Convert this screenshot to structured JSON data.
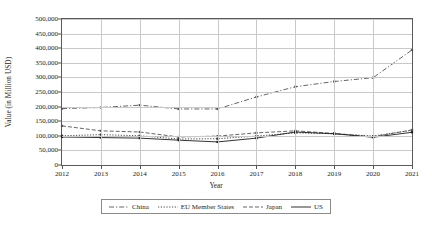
{
  "chart_data": {
    "type": "line",
    "title": "",
    "xlabel": "Year",
    "ylabel": "Value (in Million USD)",
    "x": [
      2012,
      2013,
      2014,
      2015,
      2016,
      2017,
      2018,
      2019,
      2020,
      2021
    ],
    "xtick_labels": [
      "2012",
      "2013",
      "2014",
      "2015",
      "2016",
      "2017",
      "2018",
      "2019",
      "2020",
      "2021"
    ],
    "ytick_labels": [
      "0",
      "50,000",
      "100,000",
      "150,000",
      "200,000",
      "250,000",
      "300,000",
      "350,000",
      "400,000",
      "450,000",
      "500,000"
    ],
    "ytick_values": [
      0,
      50000,
      100000,
      150000,
      200000,
      250000,
      300000,
      350000,
      400000,
      450000,
      500000
    ],
    "ylim": [
      0,
      500000
    ],
    "xlim": [
      2012,
      2021
    ],
    "grid": true,
    "legend_position": "bottom",
    "series": [
      {
        "name": "China",
        "style": "dash-dot",
        "color": "#555555",
        "values": [
          193000,
          197000,
          205000,
          192000,
          192000,
          233000,
          268000,
          286000,
          299000,
          394000
        ]
      },
      {
        "name": "EU Member States",
        "style": "dotted",
        "color": "#333333",
        "values": [
          100000,
          104000,
          100000,
          89000,
          90000,
          99000,
          110000,
          107000,
          99000,
          119000
        ]
      },
      {
        "name": "Japan",
        "style": "dashed",
        "color": "#555555",
        "values": [
          134000,
          117000,
          113000,
          96000,
          99000,
          110000,
          117000,
          108000,
          97000,
          120000
        ]
      },
      {
        "name": "US",
        "style": "solid",
        "color": "#1c1c1c",
        "values": [
          96000,
          94000,
          92000,
          85000,
          79000,
          92000,
          113000,
          107000,
          95000,
          112000
        ]
      }
    ]
  }
}
